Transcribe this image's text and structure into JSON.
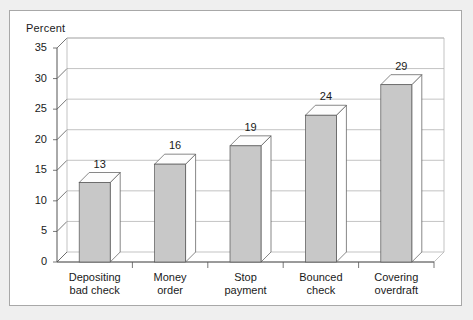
{
  "chart_data": {
    "type": "bar",
    "title": "",
    "ylabel": "Percent",
    "xlabel": "",
    "categories": [
      "Depositing bad check",
      "Money order",
      "Stop payment",
      "Bounced check",
      "Covering overdraft"
    ],
    "category_lines": [
      [
        "Depositing",
        "bad check"
      ],
      [
        "Money",
        "order"
      ],
      [
        "Stop",
        "payment"
      ],
      [
        "Bounced",
        "check"
      ],
      [
        "Covering",
        "overdraft"
      ]
    ],
    "values": [
      13,
      16,
      19,
      24,
      29
    ],
    "value_labels": [
      "13",
      "16",
      "19",
      "24",
      "29"
    ],
    "ylim": [
      0,
      35
    ],
    "ytick_values": [
      0,
      5,
      10,
      15,
      20,
      25,
      30,
      35
    ],
    "ytick_labels": [
      "0",
      "5",
      "10",
      "15",
      "20",
      "25",
      "30",
      "35"
    ],
    "grid": true,
    "legend": false,
    "style": "3d-column",
    "colors": {
      "bar_front": "#c8c8c8",
      "bar_top": "#fdfdfd",
      "bar_side": "#ffffff",
      "bar_outline": "#555555",
      "grid": "#b4b4b4",
      "axis": "#555555",
      "frame": "#a8a8a8",
      "background": "#ffffff",
      "text": "#1a1a1a"
    }
  }
}
